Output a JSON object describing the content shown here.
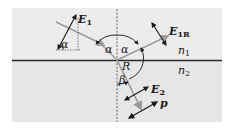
{
  "diagram": {
    "colors": {
      "background_top": "#ececec",
      "background_bottom": "#e6e6e6",
      "interface": "#2a2a2a",
      "ray": "#8a8a8a",
      "vector": "#1a1a1a",
      "normal": "#555555"
    },
    "labels": {
      "incident_field": "E",
      "incident_field_sub": "1",
      "reflected_field": "E",
      "reflected_field_sub": "1R",
      "transmitted_field": "E",
      "transmitted_field_sub": "2",
      "polarization": "p",
      "medium_top": "n",
      "medium_top_sub": "1",
      "medium_bottom": "n",
      "medium_bottom_sub": "2",
      "angle_incident": "α",
      "angle_incident_left": "α",
      "angle_reflected": "α",
      "angle_small": "α",
      "angle_refracted": "β",
      "reflection_arc": "R"
    }
  }
}
